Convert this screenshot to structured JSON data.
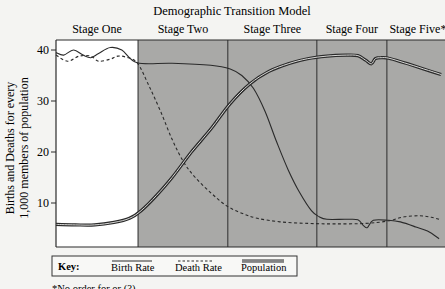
{
  "chart_data": {
    "type": "line",
    "title": "Demographic Transition Model",
    "ylabel_line1": "Births and Deaths for every",
    "ylabel_line2": "1,000 members of population",
    "xlabel": "",
    "ylim": [
      1.5,
      41
    ],
    "yticks": [
      {
        "value": 10,
        "label": "10"
      },
      {
        "value": 20,
        "label": "20"
      },
      {
        "value": 30,
        "label": "30"
      },
      {
        "value": 40,
        "label": "40"
      }
    ],
    "x_range": [
      0,
      100
    ],
    "stages": [
      {
        "label": "Stage One",
        "start": 0,
        "end": 21.2,
        "shaded": false
      },
      {
        "label": "Stage Two",
        "start": 21.2,
        "end": 44.4,
        "shaded": true
      },
      {
        "label": "Stage Three",
        "start": 44.4,
        "end": 67.4,
        "shaded": true
      },
      {
        "label": "Stage Four",
        "start": 67.4,
        "end": 85.5,
        "shaded": true
      },
      {
        "label": "Stage Five*",
        "start": 85.5,
        "end": 100,
        "shaded": true
      }
    ],
    "series": [
      {
        "name": "Birth Rate",
        "style": "solid",
        "points": [
          [
            0,
            39.5
          ],
          [
            2,
            39
          ],
          [
            4.5,
            40
          ],
          [
            7,
            39
          ],
          [
            9,
            38.5
          ],
          [
            11,
            39.3
          ],
          [
            14,
            40.5
          ],
          [
            17,
            40
          ],
          [
            21,
            37.5
          ],
          [
            30,
            37.4
          ],
          [
            40,
            37
          ],
          [
            45,
            36.3
          ],
          [
            48,
            35
          ],
          [
            51,
            32.5
          ],
          [
            54,
            28
          ],
          [
            57,
            22
          ],
          [
            60,
            16.5
          ],
          [
            63,
            12
          ],
          [
            66,
            8.5
          ],
          [
            68,
            7.3
          ],
          [
            70,
            6.8
          ],
          [
            75,
            6.8
          ],
          [
            78,
            6.7
          ],
          [
            79.5,
            5.5
          ],
          [
            80.5,
            5.2
          ],
          [
            82,
            6.6
          ],
          [
            86,
            6.6
          ],
          [
            89,
            6.3
          ],
          [
            93,
            5.3
          ],
          [
            96,
            4.5
          ],
          [
            99,
            3
          ]
        ]
      },
      {
        "name": "Death Rate",
        "style": "dashed",
        "points": [
          [
            0,
            39
          ],
          [
            3,
            37.8
          ],
          [
            6,
            38.8
          ],
          [
            9,
            38.8
          ],
          [
            11,
            37.8
          ],
          [
            14,
            38.2
          ],
          [
            16,
            38.8
          ],
          [
            18,
            38.6
          ],
          [
            21,
            37.5
          ],
          [
            24,
            33
          ],
          [
            27,
            28
          ],
          [
            30,
            22.5
          ],
          [
            33,
            18
          ],
          [
            36,
            15
          ],
          [
            40,
            12
          ],
          [
            44,
            9.5
          ],
          [
            48,
            8
          ],
          [
            52,
            7
          ],
          [
            58,
            6.3
          ],
          [
            65,
            6
          ],
          [
            72,
            5.9
          ],
          [
            80,
            6
          ],
          [
            86,
            6.5
          ],
          [
            90,
            7.3
          ],
          [
            94,
            7.5
          ],
          [
            97,
            7.2
          ],
          [
            99.5,
            6.7
          ]
        ]
      },
      {
        "name": "Population",
        "style": "double",
        "points": [
          [
            0,
            5.8
          ],
          [
            5,
            5.7
          ],
          [
            10,
            5.7
          ],
          [
            15,
            6.2
          ],
          [
            19,
            7
          ],
          [
            22,
            8.5
          ],
          [
            26,
            11.5
          ],
          [
            30,
            15
          ],
          [
            35,
            20
          ],
          [
            40,
            24.5
          ],
          [
            45,
            29.5
          ],
          [
            50,
            33.3
          ],
          [
            55,
            35.8
          ],
          [
            60,
            37.3
          ],
          [
            65,
            38.3
          ],
          [
            70,
            38.8
          ],
          [
            75,
            39
          ],
          [
            78,
            38.9
          ],
          [
            80,
            38
          ],
          [
            81.5,
            37.3
          ],
          [
            82.5,
            38.3
          ],
          [
            84,
            38.5
          ],
          [
            86,
            38.4
          ],
          [
            90,
            37.5
          ],
          [
            95,
            36.3
          ],
          [
            99.5,
            35.2
          ]
        ]
      }
    ],
    "legend": {
      "title": "Key:",
      "entries": [
        {
          "label": "Birth Rate",
          "style": "solid"
        },
        {
          "label": "Death Rate",
          "style": "dashed"
        },
        {
          "label": "Population",
          "style": "double"
        }
      ],
      "position": "bottom-left"
    },
    "footnote": "*No order for or (?)...",
    "colors": {
      "shade": "#a9a9a7",
      "line": "#2a2a2a",
      "paper": "#f4f4f2",
      "white_region": "#ffffff"
    }
  }
}
